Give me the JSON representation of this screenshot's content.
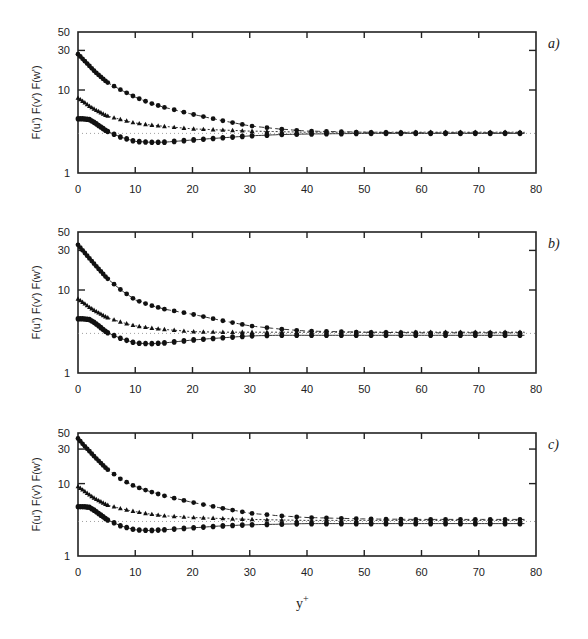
{
  "figure": {
    "xlabel": "y",
    "xlabel_sup": "+",
    "ylabel": "F(u') F(v') F(w')"
  },
  "chart_data": [
    {
      "type": "line",
      "panel_label": "a)",
      "title": "",
      "xlabel": "y+",
      "ylabel": "F(u') F(v') F(w')",
      "xlim": [
        0,
        80
      ],
      "ylim": [
        1,
        50
      ],
      "yscale": "log",
      "xticks": [
        0,
        10,
        20,
        30,
        40,
        50,
        60,
        70,
        80
      ],
      "yticks": [
        1,
        10,
        30,
        50
      ],
      "reference_line": 3,
      "x": [
        0,
        1,
        2,
        3,
        5,
        7.5,
        10,
        12.5,
        15,
        20,
        25,
        30,
        35,
        40,
        50,
        60,
        70,
        80
      ],
      "series": [
        {
          "name": "F(u')",
          "marker": "circle",
          "line": "dashed",
          "values": [
            27,
            23,
            19.5,
            16.5,
            12.5,
            10,
            8.2,
            7.0,
            6.2,
            5.1,
            4.3,
            3.7,
            3.4,
            3.2,
            3.1,
            3.05,
            3.05,
            3.05
          ]
        },
        {
          "name": "F(v')",
          "marker": "triangle",
          "line": "dotted",
          "values": [
            8,
            7.2,
            6.4,
            5.8,
            4.9,
            4.4,
            4.0,
            3.8,
            3.65,
            3.4,
            3.3,
            3.2,
            3.15,
            3.1,
            3.1,
            3.1,
            3.1,
            3.1
          ]
        },
        {
          "name": "F(w')",
          "marker": "square",
          "line": "solid",
          "values": [
            4.5,
            4.5,
            4.4,
            4.0,
            3.2,
            2.7,
            2.4,
            2.35,
            2.35,
            2.5,
            2.65,
            2.8,
            2.9,
            2.95,
            3.0,
            3.0,
            3.0,
            3.0
          ]
        }
      ]
    },
    {
      "type": "line",
      "panel_label": "b)",
      "title": "",
      "xlabel": "y+",
      "ylabel": "F(u') F(v') F(w')",
      "xlim": [
        0,
        80
      ],
      "ylim": [
        1,
        50
      ],
      "yscale": "log",
      "xticks": [
        0,
        10,
        20,
        30,
        40,
        50,
        60,
        70,
        80
      ],
      "yticks": [
        1,
        10,
        30,
        50
      ],
      "reference_line": 3,
      "x": [
        0,
        1,
        2,
        3,
        5,
        7.5,
        10,
        12.5,
        15,
        20,
        25,
        30,
        35,
        40,
        50,
        60,
        70,
        80
      ],
      "series": [
        {
          "name": "F(u')",
          "marker": "circle",
          "line": "dashed",
          "values": [
            35,
            29,
            24,
            20,
            14,
            10,
            7.6,
            6.6,
            5.9,
            5.1,
            4.3,
            3.7,
            3.4,
            3.2,
            3.1,
            3.05,
            3.05,
            3.05
          ]
        },
        {
          "name": "F(v')",
          "marker": "triangle",
          "line": "dotted",
          "values": [
            7.8,
            7.0,
            6.2,
            5.6,
            4.7,
            4.1,
            3.7,
            3.5,
            3.35,
            3.15,
            3.1,
            3.1,
            3.1,
            3.1,
            3.1,
            3.1,
            3.1,
            3.1
          ]
        },
        {
          "name": "F(w')",
          "marker": "square",
          "line": "solid",
          "values": [
            4.5,
            4.5,
            4.4,
            4.0,
            3.1,
            2.6,
            2.3,
            2.25,
            2.3,
            2.5,
            2.65,
            2.8,
            2.85,
            2.85,
            2.85,
            2.85,
            2.85,
            2.85
          ]
        }
      ]
    },
    {
      "type": "line",
      "panel_label": "c)",
      "title": "",
      "xlabel": "y+",
      "ylabel": "F(u') F(v') F(w')",
      "xlim": [
        0,
        80
      ],
      "ylim": [
        1,
        50
      ],
      "yscale": "log",
      "xticks": [
        0,
        10,
        20,
        30,
        40,
        50,
        60,
        70,
        80
      ],
      "yticks": [
        1,
        10,
        30,
        50
      ],
      "reference_line": 3,
      "x": [
        0,
        1,
        2,
        3,
        5,
        7.5,
        10,
        12.5,
        15,
        20,
        25,
        30,
        35,
        40,
        50,
        60,
        70,
        80
      ],
      "series": [
        {
          "name": "F(u')",
          "marker": "circle",
          "line": "dashed",
          "values": [
            42,
            34,
            28,
            23,
            16,
            11.5,
            9.1,
            7.8,
            6.8,
            5.5,
            4.6,
            3.9,
            3.6,
            3.4,
            3.25,
            3.2,
            3.2,
            3.2
          ]
        },
        {
          "name": "F(v')",
          "marker": "triangle",
          "line": "dotted",
          "values": [
            9.1,
            8.0,
            7.0,
            6.2,
            5.1,
            4.5,
            4.1,
            3.8,
            3.6,
            3.4,
            3.3,
            3.2,
            3.15,
            3.1,
            3.1,
            3.1,
            3.1,
            3.1
          ]
        },
        {
          "name": "F(w')",
          "marker": "square",
          "line": "solid",
          "values": [
            4.8,
            4.8,
            4.7,
            4.2,
            3.2,
            2.6,
            2.3,
            2.25,
            2.3,
            2.45,
            2.6,
            2.7,
            2.75,
            2.8,
            2.8,
            2.8,
            2.8,
            2.8
          ]
        }
      ]
    }
  ]
}
